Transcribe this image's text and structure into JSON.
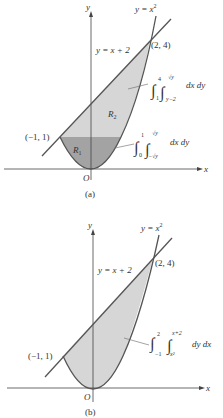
{
  "figure_a": {
    "caption": "(a)",
    "axis_x": "x",
    "axis_y": "y",
    "origin": "O",
    "curve_label": "y = x",
    "curve_exp": "2",
    "line_label": "y = x + 2",
    "point_top": "(2, 4)",
    "point_left": "(−1, 1)",
    "region1": "R",
    "region1_sub": "1",
    "region2": "R",
    "region2_sub": "2",
    "integral_r2": {
      "outer_upper": "4",
      "outer_lower": "1",
      "inner_upper": "√y",
      "inner_lower": "y−2",
      "differentials": "dx  dy"
    },
    "integral_r1": {
      "outer_upper": "1",
      "outer_lower": "0",
      "inner_upper": "√y",
      "inner_lower": "−√y",
      "differentials": "dx  dy"
    }
  },
  "figure_b": {
    "caption": "(b)",
    "axis_x": "x",
    "axis_y": "y",
    "origin": "O",
    "curve_label": "y = x",
    "curve_exp": "2",
    "line_label": "y = x + 2",
    "point_top": "(2, 4)",
    "point_left": "(−1, 1)",
    "integral": {
      "outer_upper": "2",
      "outer_lower": "−1",
      "inner_upper": "x+2",
      "inner_lower": "x²",
      "differentials": "dy  dx"
    }
  },
  "colors": {
    "region_light": "#d4d4d4",
    "region_dark": "#9a9a9a",
    "curve": "#555555",
    "axis": "#444444"
  }
}
